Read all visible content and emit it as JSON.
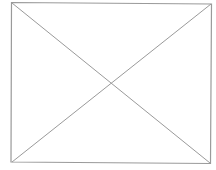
{
  "image_placeholder": {
    "icon": "image-placeholder-x",
    "stroke_color": "#9a9a9a",
    "background_color": "#ffffff"
  }
}
